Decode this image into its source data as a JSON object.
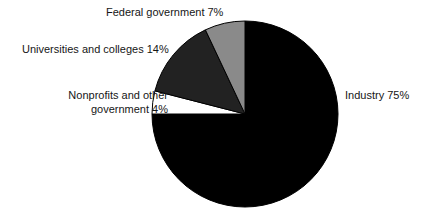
{
  "chart_data": {
    "type": "pie",
    "title": "",
    "subtitle": "",
    "xlabel": "",
    "ylabel": "",
    "grid": false,
    "legend_position": "none",
    "labels_position": "outside",
    "start_angle_deg": 0,
    "direction": "clockwise",
    "center": {
      "x": 245,
      "y": 114,
      "radius": 93
    },
    "categories": [
      "Industry",
      "Nonprofits and other government",
      "Universities and colleges",
      "Federal government"
    ],
    "values": [
      75,
      4,
      14,
      7
    ],
    "unit": "%",
    "slices": [
      {
        "name": "Industry",
        "value": 75,
        "label": "Industry 75%",
        "color": "#000000",
        "stroke": "#000000"
      },
      {
        "name": "Nonprofits and other government",
        "value": 4,
        "label": "Nonprofits and other government 4%",
        "label_line_1": "Nonprofits and other",
        "label_line_2": "government 4%",
        "color": "#ffffff",
        "stroke": "#000000"
      },
      {
        "name": "Universities and colleges",
        "value": 14,
        "label": "Universities and colleges 14%",
        "color": "#222222",
        "stroke": "#000000"
      },
      {
        "name": "Federal government",
        "value": 7,
        "label": "Federal government 7%",
        "color": "#8a8a8a",
        "stroke": "#000000"
      }
    ]
  },
  "labels": {
    "federal": "Federal government 7%",
    "universities": "Universities and colleges 14%",
    "nonprofits": "Nonprofits and other government 4%",
    "industry": "Industry 75%"
  },
  "colors": {
    "background": "#ffffff",
    "text": "#161616",
    "industry": "#000000",
    "federal": "#8a8a8a",
    "universities": "#222222",
    "nonprofits": "#ffffff",
    "outline": "#000000"
  }
}
